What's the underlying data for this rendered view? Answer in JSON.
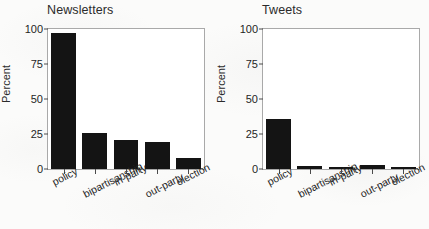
{
  "figure": {
    "background_color": "#fbfbfa",
    "bar_color": "#141414",
    "frame_color": "#a9a9a9",
    "axis_title": "Percent"
  },
  "panels": [
    {
      "id": "newsletters",
      "title": "Newsletters",
      "axis_title": "Percent"
    },
    {
      "id": "tweets",
      "title": "Tweets",
      "axis_title": "Percent"
    }
  ],
  "ticks": {
    "y": [
      "0",
      "25",
      "50",
      "75",
      "100"
    ]
  },
  "chart_data": [
    {
      "type": "bar",
      "title": "Newsletters",
      "xlabel": "",
      "ylabel": "Percent",
      "ylim": [
        0,
        100
      ],
      "yticks": [
        0,
        25,
        50,
        75,
        100
      ],
      "grid": false,
      "legend": "none",
      "categories": [
        "policy",
        "bipartisanship",
        "in-party",
        "out-party",
        "election"
      ],
      "values": [
        97,
        26,
        21,
        19,
        8
      ]
    },
    {
      "type": "bar",
      "title": "Tweets",
      "xlabel": "",
      "ylabel": "Percent",
      "ylim": [
        0,
        100
      ],
      "yticks": [
        0,
        25,
        50,
        75,
        100
      ],
      "grid": false,
      "legend": "none",
      "categories": [
        "policy",
        "bipartisanship",
        "in-party",
        "out-party",
        "election"
      ],
      "values": [
        36,
        2,
        1.5,
        3,
        1
      ]
    }
  ]
}
